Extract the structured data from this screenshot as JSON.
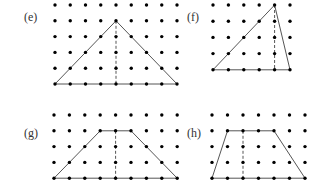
{
  "panels": [
    {
      "id": "e",
      "label": "(e)",
      "label_pos": [
        24,
        21
      ],
      "origin": [
        55,
        5
      ],
      "dx": 15.25,
      "dy": 15.8,
      "cols": 9,
      "rows": 6,
      "shape": [
        [
          0,
          5
        ],
        [
          4,
          1
        ],
        [
          8,
          5
        ]
      ],
      "dashed": [
        [
          4,
          1
        ],
        [
          4,
          5
        ]
      ]
    },
    {
      "id": "f",
      "label": "(f)",
      "label_pos": [
        187,
        21
      ],
      "origin": [
        213,
        5
      ],
      "dx": 15.4,
      "dy": 16.2,
      "cols": 6,
      "rows": 5,
      "shape": [
        [
          0,
          4
        ],
        [
          4,
          0
        ],
        [
          5,
          4
        ]
      ],
      "dashed": [
        [
          4,
          0
        ],
        [
          4,
          4
        ]
      ]
    },
    {
      "id": "g",
      "label": "(g)",
      "label_pos": [
        24,
        137
      ],
      "origin": [
        54,
        115
      ],
      "dx": 15.4,
      "dy": 15.8,
      "cols": 9,
      "rows": 5,
      "shape": [
        [
          0,
          4
        ],
        [
          3,
          1
        ],
        [
          5,
          1
        ],
        [
          8,
          4
        ]
      ],
      "dashed": [
        [
          4,
          1
        ],
        [
          4,
          4
        ]
      ]
    },
    {
      "id": "h",
      "label": "(h)",
      "label_pos": [
        187,
        137
      ],
      "origin": [
        212,
        115
      ],
      "dx": 15.5,
      "dy": 15.8,
      "cols": 7,
      "rows": 5,
      "shape": [
        [
          0,
          4
        ],
        [
          1,
          1
        ],
        [
          4,
          1
        ],
        [
          6,
          4
        ]
      ],
      "dashed": [
        [
          2,
          1
        ],
        [
          2,
          4
        ]
      ]
    }
  ],
  "colors": {
    "dot": "#000000",
    "line": "#555555",
    "label": "#333333"
  }
}
